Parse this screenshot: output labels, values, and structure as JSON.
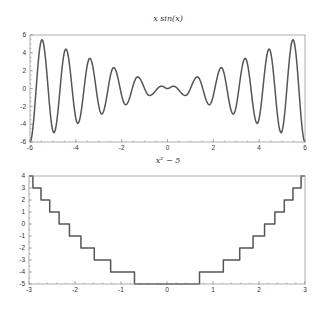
{
  "figure": {
    "width": 323,
    "height": 313,
    "background": "#ffffff",
    "line_color": "#555555",
    "frame_color": "#9a9a9a"
  },
  "chart_data": [
    {
      "type": "line",
      "title": "x sin(x)",
      "xlabel": "",
      "ylabel": "",
      "xlim": [
        -6,
        6
      ],
      "ylim": [
        -6,
        6
      ],
      "grid": false,
      "legend": null,
      "xticks": [
        -6,
        -4,
        -2,
        0,
        2,
        4,
        6
      ],
      "xtick_labels": [
        "-6",
        "-4",
        "-2",
        "0",
        "2",
        "4",
        "6"
      ],
      "yticks": [
        -6,
        -4,
        -2,
        0,
        2,
        4,
        6
      ],
      "ytick_labels": [
        "-6",
        "-4",
        "-2",
        "0",
        "2",
        "4",
        "6"
      ],
      "minor_tick_step_x": 0.5,
      "minor_tick_step_y": 0.5,
      "frame_px": {
        "left": 30,
        "right": 305,
        "top": 35,
        "bottom": 142
      },
      "title_px": {
        "x": 168,
        "y": 21
      },
      "interp": "sine-arcs-between-extrema",
      "series": [
        {
          "name": "x sin(x)",
          "x": [
            -6.0,
            -5.478,
            -4.957,
            -4.435,
            -3.913,
            -3.391,
            -2.87,
            -2.348,
            -1.826,
            -1.304,
            -0.783,
            -0.261,
            0.0,
            0.261,
            0.783,
            1.304,
            1.826,
            2.348,
            2.87,
            3.391,
            3.913,
            4.435,
            4.957,
            5.478,
            6.0
          ],
          "y": [
            -6.0,
            5.478,
            -4.957,
            4.435,
            -3.913,
            3.391,
            -2.87,
            2.348,
            -1.826,
            1.304,
            -0.783,
            0.261,
            0.0,
            0.261,
            -0.783,
            1.304,
            -1.826,
            2.348,
            -2.87,
            3.391,
            -3.913,
            4.435,
            -4.957,
            5.478,
            -6.0
          ]
        }
      ]
    },
    {
      "type": "line",
      "title": "x² − 5",
      "xlabel": "",
      "ylabel": "",
      "xlim": [
        -3,
        3
      ],
      "ylim": [
        -5,
        4
      ],
      "grid": false,
      "legend": null,
      "xticks": [
        -3,
        -2,
        -1,
        0,
        1,
        2,
        3
      ],
      "xtick_labels": [
        "-3",
        "-2",
        "-1",
        "0",
        "1",
        "2",
        "3"
      ],
      "yticks": [
        -5,
        -4,
        -3,
        -2,
        -1,
        0,
        1,
        2,
        3,
        4
      ],
      "ytick_labels": [
        "-5",
        "-4",
        "-3",
        "-2",
        "-1",
        "0",
        "1",
        "2",
        "3",
        "4"
      ],
      "minor_tick_step_x": 0.2,
      "minor_tick_step_y": 0.5,
      "frame_px": {
        "left": 29,
        "right": 305,
        "top": 176,
        "bottom": 284
      },
      "title_px": {
        "x": 168,
        "y": 163
      },
      "interp": "step",
      "series": [
        {
          "name": "round(x² − 5)",
          "x": [
            -3.0,
            -2.915,
            -2.739,
            -2.55,
            -2.345,
            -2.121,
            -1.871,
            -1.581,
            -1.225,
            -0.707,
            0.707,
            1.225,
            1.581,
            1.871,
            2.121,
            2.345,
            2.55,
            2.739,
            2.915,
            3.0
          ],
          "y": [
            4,
            3,
            2,
            1,
            0,
            -1,
            -2,
            -3,
            -4,
            -5,
            -4,
            -3,
            -2,
            -1,
            0,
            1,
            2,
            3,
            4,
            4
          ]
        }
      ]
    }
  ],
  "labels": {
    "top_title": "x sin(x)",
    "bottom_title": "x² − 5"
  }
}
